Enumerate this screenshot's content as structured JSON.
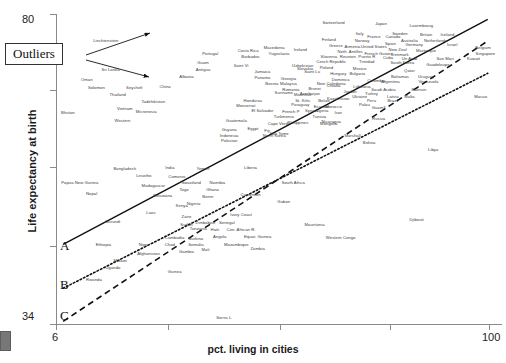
{
  "chart_data": {
    "type": "scatter",
    "title": "",
    "xlabel": "pct. living in cities",
    "ylabel": "Life expectancy at birth",
    "xlim": [
      6,
      100
    ],
    "ylim": [
      34,
      80
    ],
    "xticks": [
      "6",
      "100"
    ],
    "yticks": [
      "80",
      "34"
    ],
    "grid": false,
    "legend": "none",
    "annotations": {
      "outliers_label": "Outliers",
      "outlier_targets": [
        "Liechtenstein",
        "Sri Lanka"
      ],
      "line_labels": [
        "A",
        "B",
        "C"
      ],
      "line_styles": [
        "solid",
        "dotted",
        "dashed"
      ]
    },
    "points": [
      {
        "label": "Liechtenstein",
        "x": 16.5,
        "y": 76.1
      },
      {
        "label": "Sri Lanka",
        "x": 17.5,
        "y": 71.9
      },
      {
        "label": "Oman",
        "x": 12.5,
        "y": 70.3
      },
      {
        "label": "Solomon",
        "x": 14.5,
        "y": 69.1
      },
      {
        "label": "Seychelt",
        "x": 22.5,
        "y": 69.2
      },
      {
        "label": "Thailand",
        "x": 19.0,
        "y": 68.1
      },
      {
        "label": "China",
        "x": 29.0,
        "y": 69.3
      },
      {
        "label": "Albania",
        "x": 33.5,
        "y": 70.8
      },
      {
        "label": "Tadzhikistan",
        "x": 26.5,
        "y": 67.1
      },
      {
        "label": "Vietnam",
        "x": 20.5,
        "y": 66.0
      },
      {
        "label": "Micronesia",
        "x": 25.0,
        "y": 65.6
      },
      {
        "label": "Bhutan",
        "x": 8.5,
        "y": 65.5
      },
      {
        "label": "Western",
        "x": 20.0,
        "y": 64.2
      },
      {
        "label": "Portugal",
        "x": 38.5,
        "y": 74.2
      },
      {
        "label": "Guam",
        "x": 37.0,
        "y": 72.9
      },
      {
        "label": "Antigua",
        "x": 37.0,
        "y": 71.9
      },
      {
        "label": "Barbados",
        "x": 47.0,
        "y": 73.8
      },
      {
        "label": "Costa Rica",
        "x": 46.5,
        "y": 74.6
      },
      {
        "label": "Saint Vi",
        "x": 45.0,
        "y": 72.4
      },
      {
        "label": "Jamaica",
        "x": 49.5,
        "y": 71.5
      },
      {
        "label": "Panama",
        "x": 49.5,
        "y": 70.6
      },
      {
        "label": "Macedonia",
        "x": 52.0,
        "y": 75.1
      },
      {
        "label": "Yugoslavia",
        "x": 53.0,
        "y": 74.2
      },
      {
        "label": "Ireland",
        "x": 57.5,
        "y": 74.8
      },
      {
        "label": "Slovakia",
        "x": 58.5,
        "y": 72.0
      },
      {
        "label": "Georgia",
        "x": 55.0,
        "y": 70.5
      },
      {
        "label": "Uzbekistan",
        "x": 58.0,
        "y": 72.5
      },
      {
        "label": "Bosnia",
        "x": 51.5,
        "y": 69.8
      },
      {
        "label": "Malaysia",
        "x": 55.0,
        "y": 69.7
      },
      {
        "label": "Saint Lu",
        "x": 60.0,
        "y": 71.5
      },
      {
        "label": "Romania",
        "x": 55.5,
        "y": 68.9
      },
      {
        "label": "Brunei",
        "x": 60.5,
        "y": 69.0
      },
      {
        "label": "New Caledonia",
        "x": 64.0,
        "y": 69.8
      },
      {
        "label": "Mauritius",
        "x": 58.0,
        "y": 68.1
      },
      {
        "label": "St. Kitts",
        "x": 58.0,
        "y": 67.3
      },
      {
        "label": "Belize",
        "x": 62.5,
        "y": 67.2
      },
      {
        "label": "Suriname",
        "x": 54.0,
        "y": 68.4
      },
      {
        "label": "Azerbaijan",
        "x": 59.5,
        "y": 68.3
      },
      {
        "label": "Paraguay",
        "x": 57.5,
        "y": 66.6
      },
      {
        "label": "Ecuador",
        "x": 62.0,
        "y": 66.3
      },
      {
        "label": "Morocco",
        "x": 64.5,
        "y": 66.4
      },
      {
        "label": "Honduras",
        "x": 47.5,
        "y": 67.3
      },
      {
        "label": "Monserrat",
        "x": 46.0,
        "y": 66.5
      },
      {
        "label": "El Salvador",
        "x": 49.5,
        "y": 65.8
      },
      {
        "label": "French P",
        "x": 55.5,
        "y": 65.6
      },
      {
        "label": "Syria",
        "x": 59.5,
        "y": 65.7
      },
      {
        "label": "Algeria",
        "x": 62.0,
        "y": 65.7
      },
      {
        "label": "Iran",
        "x": 65.5,
        "y": 65.5
      },
      {
        "label": "Turkmenia",
        "x": 54.0,
        "y": 64.8
      },
      {
        "label": "Tunisia",
        "x": 61.5,
        "y": 64.9
      },
      {
        "label": "Guatemala",
        "x": 44.0,
        "y": 64.3
      },
      {
        "label": "Cape Verde",
        "x": 53.0,
        "y": 63.8
      },
      {
        "label": "Philippines",
        "x": 57.0,
        "y": 64.0
      },
      {
        "label": "Nicaragua",
        "x": 64.0,
        "y": 64.1
      },
      {
        "label": "Mongolia",
        "x": 63.5,
        "y": 63.8
      },
      {
        "label": "Guyana",
        "x": 42.5,
        "y": 62.9
      },
      {
        "label": "Egypt",
        "x": 47.5,
        "y": 63.1
      },
      {
        "label": "Fiji",
        "x": 50.5,
        "y": 62.8
      },
      {
        "label": "Sao Tome",
        "x": 53.0,
        "y": 62.3
      },
      {
        "label": "North Korea",
        "x": 52.0,
        "y": 62.1
      },
      {
        "label": "Indonesia",
        "x": 42.5,
        "y": 62.1
      },
      {
        "label": "Pakistan",
        "x": 42.5,
        "y": 61.3
      },
      {
        "label": "Switzerland",
        "x": 64.5,
        "y": 78.8
      },
      {
        "label": "Japan",
        "x": 74.5,
        "y": 78.6
      },
      {
        "label": "Luxembourg",
        "x": 83.0,
        "y": 78.3
      },
      {
        "label": "Sweden",
        "x": 78.5,
        "y": 77.2
      },
      {
        "label": "Britain",
        "x": 84.0,
        "y": 77.1
      },
      {
        "label": "Iceland",
        "x": 88.5,
        "y": 77.0
      },
      {
        "label": "Italy",
        "x": 70.0,
        "y": 77.2
      },
      {
        "label": "France",
        "x": 73.0,
        "y": 76.8
      },
      {
        "label": "Canada",
        "x": 77.0,
        "y": 76.8
      },
      {
        "label": "Australia",
        "x": 80.5,
        "y": 76.2
      },
      {
        "label": "Netherlands",
        "x": 86.0,
        "y": 76.1
      },
      {
        "label": "Finland",
        "x": 63.5,
        "y": 76.3
      },
      {
        "label": "Norway",
        "x": 70.5,
        "y": 76.1
      },
      {
        "label": "Spain",
        "x": 76.5,
        "y": 75.7
      },
      {
        "label": "Germany",
        "x": 81.5,
        "y": 75.5
      },
      {
        "label": "Israel",
        "x": 89.5,
        "y": 75.5
      },
      {
        "label": "Greece",
        "x": 65.0,
        "y": 75.4
      },
      {
        "label": "Armenia",
        "x": 68.5,
        "y": 75.2
      },
      {
        "label": "United States",
        "x": 73.0,
        "y": 75.2
      },
      {
        "label": "New Zeal",
        "x": 78.0,
        "y": 74.8
      },
      {
        "label": "Martinique",
        "x": 84.0,
        "y": 74.7
      },
      {
        "label": "Belgium",
        "x": 96.0,
        "y": 75.1
      },
      {
        "label": "Neth. Antilles",
        "x": 68.0,
        "y": 74.5
      },
      {
        "label": "French Guiana",
        "x": 74.0,
        "y": 74.2
      },
      {
        "label": "Denmark",
        "x": 78.5,
        "y": 74.1
      },
      {
        "label": "Singapore",
        "x": 96.5,
        "y": 74.2
      },
      {
        "label": "Slovenia",
        "x": 63.5,
        "y": 73.8
      },
      {
        "label": "Reunion",
        "x": 67.5,
        "y": 73.7
      },
      {
        "label": "Puerto R",
        "x": 71.5,
        "y": 73.7
      },
      {
        "label": "Cuba",
        "x": 76.0,
        "y": 73.6
      },
      {
        "label": "Un Arab",
        "x": 80.5,
        "y": 73.4
      },
      {
        "label": "San Mari",
        "x": 88.0,
        "y": 73.5
      },
      {
        "label": "Kuwait",
        "x": 94.0,
        "y": 73.5
      },
      {
        "label": "Czech Republic",
        "x": 64.0,
        "y": 73.0
      },
      {
        "label": "Trinidad",
        "x": 71.5,
        "y": 73.0
      },
      {
        "label": "South Korea",
        "x": 79.0,
        "y": 72.9
      },
      {
        "label": "Guadeloupe",
        "x": 86.5,
        "y": 72.6
      },
      {
        "label": "Poland",
        "x": 63.0,
        "y": 72.1
      },
      {
        "label": "Mexico",
        "x": 70.0,
        "y": 72.0
      },
      {
        "label": "Qatar",
        "x": 80.5,
        "y": 71.7
      },
      {
        "label": "Hungary",
        "x": 65.5,
        "y": 71.2
      },
      {
        "label": "Bulgaria",
        "x": 69.5,
        "y": 71.2
      },
      {
        "label": "Bahamas",
        "x": 78.5,
        "y": 70.8
      },
      {
        "label": "Uruguay",
        "x": 84.0,
        "y": 70.8
      },
      {
        "label": "Dominica",
        "x": 66.0,
        "y": 70.3
      },
      {
        "label": "Colombia",
        "x": 73.5,
        "y": 70.2
      },
      {
        "label": "Argentina",
        "x": 76.5,
        "y": 70.0
      },
      {
        "label": "Venezuela",
        "x": 84.5,
        "y": 70.0
      },
      {
        "label": "Croatia",
        "x": 64.5,
        "y": 69.5
      },
      {
        "label": "Lithuania",
        "x": 70.5,
        "y": 69.3
      },
      {
        "label": "Saudi Arabia",
        "x": 75.0,
        "y": 68.8
      },
      {
        "label": "Bahrain",
        "x": 82.5,
        "y": 68.8
      },
      {
        "label": "Jordan",
        "x": 68.0,
        "y": 68.6
      },
      {
        "label": "Turkey",
        "x": 72.5,
        "y": 68.3
      },
      {
        "label": "Ukraine",
        "x": 70.0,
        "y": 67.9
      },
      {
        "label": "Latvia",
        "x": 77.0,
        "y": 67.9
      },
      {
        "label": "Malta",
        "x": 80.5,
        "y": 67.9
      },
      {
        "label": "Kazakhstan",
        "x": 65.5,
        "y": 67.6
      },
      {
        "label": "Peru",
        "x": 72.5,
        "y": 67.2
      },
      {
        "label": "Brazil",
        "x": 77.0,
        "y": 67.2
      },
      {
        "label": "Palau",
        "x": 71.0,
        "y": 66.7
      },
      {
        "label": "Guam3",
        "x": 74.0,
        "y": 66.2
      },
      {
        "label": "Macao",
        "x": 95.5,
        "y": 67.8
      },
      {
        "label": "Russia",
        "x": 74.0,
        "y": 64.6
      },
      {
        "label": "Marshall",
        "x": 68.5,
        "y": 62.1
      },
      {
        "label": "Bolivia",
        "x": 72.0,
        "y": 61.0
      },
      {
        "label": "Libya",
        "x": 85.5,
        "y": 60.0
      },
      {
        "label": "Bangladesh",
        "x": 20.5,
        "y": 57.2
      },
      {
        "label": "India",
        "x": 30.0,
        "y": 57.3
      },
      {
        "label": "Yemen",
        "x": 37.0,
        "y": 57.2
      },
      {
        "label": "Lesotho",
        "x": 24.5,
        "y": 56.1
      },
      {
        "label": "Comoros",
        "x": 31.5,
        "y": 56.0
      },
      {
        "label": "Liberia",
        "x": 47.0,
        "y": 57.3
      },
      {
        "label": "Papua New Guinea",
        "x": 11.0,
        "y": 55.1
      },
      {
        "label": "Madagascar",
        "x": 26.5,
        "y": 54.7
      },
      {
        "label": "Swaziland",
        "x": 34.5,
        "y": 55.0
      },
      {
        "label": "Namibia",
        "x": 40.0,
        "y": 55.0
      },
      {
        "label": "Togo",
        "x": 33.0,
        "y": 54.0
      },
      {
        "label": "Ghana",
        "x": 39.0,
        "y": 54.0
      },
      {
        "label": "South Africa",
        "x": 56.0,
        "y": 55.1
      },
      {
        "label": "Nepal",
        "x": 13.5,
        "y": 53.4
      },
      {
        "label": "Botswana",
        "x": 28.5,
        "y": 53.1
      },
      {
        "label": "Benin",
        "x": 38.0,
        "y": 53.0
      },
      {
        "label": "Cameroon",
        "x": 47.0,
        "y": 53.3
      },
      {
        "label": "Nigeria",
        "x": 35.0,
        "y": 52.0
      },
      {
        "label": "Gabon",
        "x": 54.0,
        "y": 52.2
      },
      {
        "label": "Kenya",
        "x": 32.5,
        "y": 51.6
      },
      {
        "label": "Laos",
        "x": 26.0,
        "y": 50.6
      },
      {
        "label": "Zaire",
        "x": 33.5,
        "y": 50.1
      },
      {
        "label": "Ivory Coast",
        "x": 45.0,
        "y": 50.3
      },
      {
        "label": "Burundi",
        "x": 18.0,
        "y": 49.3
      },
      {
        "label": "Sudan",
        "x": 33.5,
        "y": 48.9
      },
      {
        "label": "Zimbabwe",
        "x": 37.5,
        "y": 49.1
      },
      {
        "label": "Senegal",
        "x": 42.0,
        "y": 49.2
      },
      {
        "label": "Mauritania",
        "x": 60.5,
        "y": 48.8
      },
      {
        "label": "Tanzania",
        "x": 36.0,
        "y": 48.2
      },
      {
        "label": "Haiti",
        "x": 39.5,
        "y": 48.1
      },
      {
        "label": "Cen. African R.",
        "x": 45.0,
        "y": 48.1
      },
      {
        "label": "Cambodia",
        "x": 31.0,
        "y": 46.9
      },
      {
        "label": "Ethiopia",
        "x": 16.0,
        "y": 45.8
      },
      {
        "label": "Niger",
        "x": 24.5,
        "y": 45.9
      },
      {
        "label": "Chad",
        "x": 30.0,
        "y": 45.9
      },
      {
        "label": "Somalia",
        "x": 35.5,
        "y": 45.9
      },
      {
        "label": "Burkina",
        "x": 35.5,
        "y": 46.7
      },
      {
        "label": "Angola",
        "x": 40.5,
        "y": 47.0
      },
      {
        "label": "Equat. Guinea",
        "x": 48.5,
        "y": 47.1
      },
      {
        "label": "Mali",
        "x": 37.5,
        "y": 45.2
      },
      {
        "label": "Gambia",
        "x": 33.5,
        "y": 44.8
      },
      {
        "label": "Mozambique",
        "x": 44.0,
        "y": 45.8
      },
      {
        "label": "Zambia",
        "x": 48.5,
        "y": 45.3
      },
      {
        "label": "Western Congo",
        "x": 66.0,
        "y": 46.9
      },
      {
        "label": "Djibouti",
        "x": 82.0,
        "y": 49.6
      },
      {
        "label": "Afghanistan",
        "x": 25.5,
        "y": 44.5
      },
      {
        "label": "Malawi",
        "x": 19.5,
        "y": 43.5
      },
      {
        "label": "Uganda",
        "x": 18.0,
        "y": 42.4
      },
      {
        "label": "Guinea",
        "x": 31.0,
        "y": 41.8
      },
      {
        "label": "Rwanda",
        "x": 14.0,
        "y": 40.7
      },
      {
        "label": "Sierra L.",
        "x": 41.5,
        "y": 35.1
      }
    ],
    "lines": [
      {
        "name": "A",
        "style": "solid",
        "x1": 7.5,
        "y1": 45.8,
        "x2": 97.0,
        "y2": 79.2
      },
      {
        "name": "B",
        "style": "dotted",
        "x1": 7.5,
        "y1": 39.3,
        "x2": 97.0,
        "y2": 71.2
      },
      {
        "name": "C",
        "style": "dashed",
        "x1": 7.5,
        "y1": 34.4,
        "x2": 97.0,
        "y2": 76.0
      }
    ]
  },
  "axes": {
    "y_title": "Life expectancy at birth",
    "x_title": "pct. living in cities",
    "y_top_tick": "80",
    "y_bottom_tick": "34",
    "x_left_tick": "6",
    "x_right_tick": "100"
  },
  "callout": {
    "label": "Outliers"
  },
  "line_labels": {
    "a": "A",
    "b": "B",
    "c": "C"
  }
}
